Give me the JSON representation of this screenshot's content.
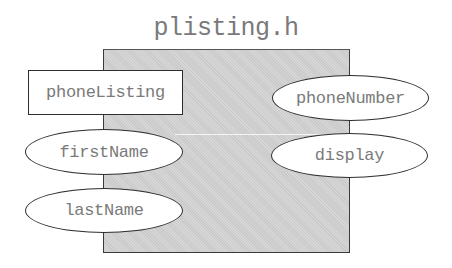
{
  "diagram": {
    "title": "plisting.h",
    "class_box": {
      "label": "phoneListing"
    },
    "members_left": [
      {
        "label": "firstName"
      },
      {
        "label": "lastName"
      }
    ],
    "members_right": [
      {
        "label": "phoneNumber"
      },
      {
        "label": "display"
      }
    ],
    "colors": {
      "box_fill": "#d2d2d2",
      "border": "#2e2e2e",
      "text": "#7a7a7a",
      "node_fill": "#ffffff"
    }
  }
}
